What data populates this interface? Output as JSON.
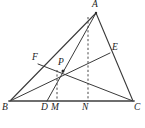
{
  "figure": {
    "caption": "",
    "background_color": "#ffffff",
    "stroke_color": "#3a3a3a",
    "base_stroke_color": "#6e6e6e",
    "label_color": "#1a1a1a",
    "points": [
      {
        "name": "A",
        "label": "A",
        "x": 96,
        "y": 13,
        "label_x": 93,
        "label_y": 1,
        "on": "apex"
      },
      {
        "name": "B",
        "label": "B",
        "x": 10,
        "y": 101,
        "label_x": 4,
        "label_y": 104,
        "on": "base-left"
      },
      {
        "name": "C",
        "label": "C",
        "x": 133,
        "y": 101,
        "label_x": 134,
        "label_y": 104,
        "on": "base-right"
      },
      {
        "name": "E",
        "label": "E",
        "x": 110,
        "y": 53,
        "label_x": 113,
        "label_y": 43,
        "on": "side-AC"
      },
      {
        "name": "F",
        "label": "F",
        "x": 38,
        "y": 64,
        "label_x": 33,
        "label_y": 53,
        "on": "side-AB"
      },
      {
        "name": "P",
        "label": "P",
        "x": 63,
        "y": 71,
        "label_x": 58,
        "label_y": 59,
        "on": "interior"
      },
      {
        "name": "D",
        "label": "D",
        "x": 47,
        "y": 101,
        "label_x": 42,
        "label_y": 104,
        "on": "base-BC"
      },
      {
        "name": "M",
        "label": "M",
        "x": 57,
        "y": 101,
        "label_x": 52,
        "label_y": 104,
        "on": "base-BC"
      },
      {
        "name": "N",
        "label": "N",
        "x": 88,
        "y": 101,
        "label_x": 83,
        "label_y": 104,
        "on": "base-BC"
      }
    ],
    "segments": [
      {
        "name": "side-AB",
        "from": "B",
        "to": "A",
        "style": "solid",
        "width": 1.1
      },
      {
        "name": "side-AC",
        "from": "A",
        "to": "C",
        "style": "solid",
        "width": 1.1
      },
      {
        "name": "side-BC",
        "from": "B",
        "to": "C",
        "style": "solid",
        "width": 1.8
      },
      {
        "name": "cevian-BE",
        "from": "B",
        "to": "E",
        "style": "solid",
        "width": 1.0
      },
      {
        "name": "cevian-FC",
        "from": "F",
        "to": "C",
        "style": "solid",
        "width": 1.0
      },
      {
        "name": "cevian-AD",
        "from": "A",
        "to": "D",
        "style": "solid",
        "width": 1.0
      },
      {
        "name": "altitude-PM",
        "from": "P",
        "to": "M",
        "style": "dashed",
        "width": 1.0
      },
      {
        "name": "altitude-AN",
        "from": "A",
        "to": "N",
        "style": "dashed",
        "width": 1.0
      }
    ]
  }
}
